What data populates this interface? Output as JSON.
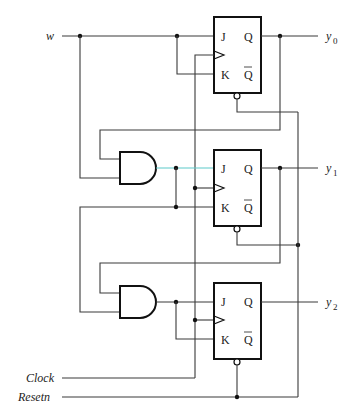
{
  "diagram": {
    "type": "circuit",
    "inputs": {
      "w": "w",
      "clock": "Clock",
      "reset": "Resetn"
    },
    "outputs": [
      {
        "name": "y",
        "sub": "0"
      },
      {
        "name": "y",
        "sub": "1"
      },
      {
        "name": "y",
        "sub": "2"
      }
    ],
    "flip_flops": [
      {
        "id": "ff0",
        "j": "J",
        "k": "K",
        "q": "Q",
        "qbar": "Q"
      },
      {
        "id": "ff1",
        "j": "J",
        "k": "K",
        "q": "Q",
        "qbar": "Q"
      },
      {
        "id": "ff2",
        "j": "J",
        "k": "K",
        "q": "Q",
        "qbar": "Q"
      }
    ],
    "gates": [
      {
        "id": "and1",
        "type": "AND"
      },
      {
        "id": "and2",
        "type": "AND"
      }
    ]
  }
}
